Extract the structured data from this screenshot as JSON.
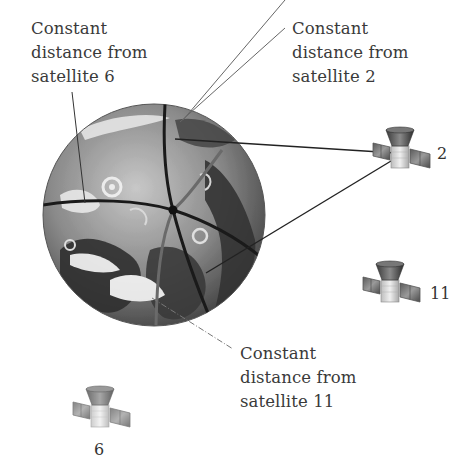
{
  "diagram": {
    "labels": {
      "sat6_arc": [
        "Constant",
        "distance from",
        "satellite 6"
      ],
      "sat2_arc": [
        "Constant",
        "distance from",
        "satellite 2"
      ],
      "sat11_arc": [
        "Constant",
        "distance from",
        "satellite 11"
      ]
    },
    "satellites": [
      {
        "id": "2",
        "label": "2",
        "icon": "satellite-icon"
      },
      {
        "id": "11",
        "label": "11",
        "icon": "satellite-icon"
      },
      {
        "id": "6",
        "label": "6",
        "icon": "satellite-icon"
      }
    ],
    "globe": {
      "icon": "earth-globe-icon"
    },
    "intersection": {
      "icon": "receiver-position-dot"
    },
    "colors": {
      "text": "#3a3a3a",
      "arc": "#1a1a1a",
      "leader": "#555555",
      "globe_light": "#b8b8b8",
      "globe_dark": "#3c3c3c"
    }
  }
}
